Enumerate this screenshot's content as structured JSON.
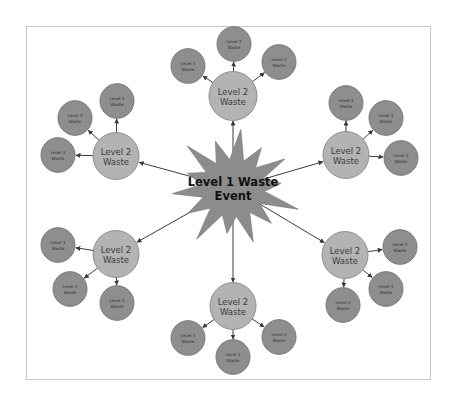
{
  "diagram": {
    "type": "hierarchy-radial",
    "colors": {
      "level1": "#8c8c8c",
      "level2": "#b3b3b3",
      "level3": "#8e8e8e",
      "frame_border": "#c8c8c8",
      "edge": "#3a3a3a"
    },
    "center": {
      "label_line1": "Level 1 Waste",
      "label_line2": "Event",
      "x": 233,
      "y": 188
    },
    "clusters": [
      {
        "id": "top",
        "l2": {
          "x": 233,
          "y": 96,
          "r": 24,
          "line1": "Level 2",
          "line2": "Waste"
        },
        "l3": [
          {
            "x": 188,
            "y": 66,
            "line1": "Level 3",
            "line2": "Waste"
          },
          {
            "x": 234,
            "y": 44,
            "line1": "Level 3",
            "line2": "Waste"
          },
          {
            "x": 279,
            "y": 62,
            "line1": "Level 3",
            "line2": "Waste"
          }
        ]
      },
      {
        "id": "upper-left",
        "l2": {
          "x": 116,
          "y": 156,
          "r": 23,
          "line1": "Level 2",
          "line2": "Waste"
        },
        "l3": [
          {
            "x": 75,
            "y": 118,
            "line1": "Level 3",
            "line2": "Waste"
          },
          {
            "x": 117,
            "y": 101,
            "line1": "Level 3",
            "line2": "Waste"
          },
          {
            "x": 58,
            "y": 155,
            "line1": "Level 3",
            "line2": "Waste"
          }
        ]
      },
      {
        "id": "upper-right",
        "l2": {
          "x": 346,
          "y": 155,
          "r": 23,
          "line1": "Level 2",
          "line2": "Waste"
        },
        "l3": [
          {
            "x": 346,
            "y": 103,
            "line1": "Level 3",
            "line2": "Waste"
          },
          {
            "x": 386,
            "y": 118,
            "line1": "Level 3",
            "line2": "Waste"
          },
          {
            "x": 401,
            "y": 158,
            "line1": "Level 3",
            "line2": "Waste"
          }
        ]
      },
      {
        "id": "lower-left",
        "l2": {
          "x": 116,
          "y": 254,
          "r": 23,
          "line1": "Level 2",
          "line2": "Waste"
        },
        "l3": [
          {
            "x": 58,
            "y": 245,
            "line1": "Level 3",
            "line2": "Waste"
          },
          {
            "x": 70,
            "y": 289,
            "line1": "Level 3",
            "line2": "Waste"
          },
          {
            "x": 117,
            "y": 303,
            "line1": "Level 3",
            "line2": "Waste"
          }
        ]
      },
      {
        "id": "lower-right",
        "l2": {
          "x": 345,
          "y": 255,
          "r": 23,
          "line1": "Level 2",
          "line2": "Waste"
        },
        "l3": [
          {
            "x": 400,
            "y": 247,
            "line1": "Level 3",
            "line2": "Waste"
          },
          {
            "x": 386,
            "y": 289,
            "line1": "Level 3",
            "line2": "Waste"
          },
          {
            "x": 343,
            "y": 305,
            "line1": "Level 3",
            "line2": "Waste"
          }
        ]
      },
      {
        "id": "bottom",
        "l2": {
          "x": 233,
          "y": 306,
          "r": 23,
          "line1": "Level 2",
          "line2": "Waste"
        },
        "l3": [
          {
            "x": 188,
            "y": 338,
            "line1": "Level 3",
            "line2": "Waste"
          },
          {
            "x": 233,
            "y": 357,
            "line1": "Level 3",
            "line2": "Waste"
          },
          {
            "x": 279,
            "y": 337,
            "line1": "Level 3",
            "line2": "Waste"
          }
        ]
      }
    ],
    "l3_radius": 17
  }
}
